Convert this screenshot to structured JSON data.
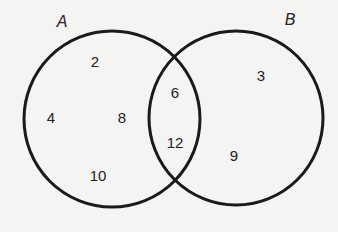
{
  "diagram": {
    "type": "venn",
    "sets": [
      {
        "name": "A",
        "cx": 112,
        "cy": 119,
        "r": 88,
        "label_x": 62,
        "label_y": 22
      },
      {
        "name": "B",
        "cx": 236,
        "cy": 118,
        "r": 87,
        "label_x": 290,
        "label_y": 20
      }
    ],
    "stroke_color": "#1a1a1a",
    "regions": {
      "A_only": [
        {
          "value": "2",
          "x": 95,
          "y": 61
        },
        {
          "value": "4",
          "x": 51,
          "y": 117
        },
        {
          "value": "8",
          "x": 122,
          "y": 117
        },
        {
          "value": "10",
          "x": 98,
          "y": 175
        }
      ],
      "A_and_B": [
        {
          "value": "6",
          "x": 175,
          "y": 92
        },
        {
          "value": "12",
          "x": 175,
          "y": 142
        }
      ],
      "B_only": [
        {
          "value": "3",
          "x": 261,
          "y": 75
        },
        {
          "value": "9",
          "x": 234,
          "y": 155
        }
      ]
    }
  }
}
